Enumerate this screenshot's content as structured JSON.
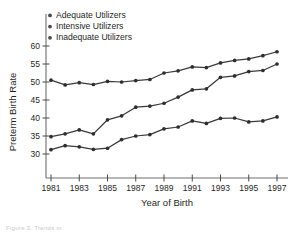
{
  "chart_data": {
    "type": "line",
    "title": "",
    "xlabel": "Year of Birth",
    "ylabel": "Preterm Birth Rate",
    "x": [
      1981,
      1982,
      1983,
      1984,
      1985,
      1986,
      1987,
      1988,
      1989,
      1990,
      1991,
      1992,
      1993,
      1994,
      1995,
      1996,
      1997
    ],
    "xtick_labels": [
      "1981",
      "1983",
      "1985",
      "1987",
      "1989",
      "1991",
      "1993",
      "1995",
      "1997"
    ],
    "xticks": [
      1981,
      1983,
      1985,
      1987,
      1989,
      1991,
      1993,
      1995,
      1997
    ],
    "ytick_labels": [
      "30",
      "35",
      "40",
      "45",
      "50",
      "55",
      "60"
    ],
    "yticks": [
      30,
      35,
      40,
      45,
      50,
      55,
      60
    ],
    "ylim": [
      28.5,
      61.5
    ],
    "xlim": [
      1980.3,
      1997.7
    ],
    "grid": false,
    "legend_position": "top-left",
    "marker": "circle",
    "series": [
      {
        "name": "Adequate Utilizers",
        "color": "#2e2e2e",
        "values": [
          50.5,
          49.2,
          49.8,
          49.3,
          50.2,
          50.0,
          50.4,
          50.7,
          52.5,
          53.1,
          54.2,
          54.0,
          55.3,
          56.0,
          56.4,
          57.3,
          58.4
        ]
      },
      {
        "name": "Intensive Utilizers",
        "color": "#2e2e2e",
        "values": [
          34.8,
          35.6,
          36.7,
          35.6,
          39.5,
          40.6,
          43.0,
          43.3,
          44.1,
          45.8,
          47.8,
          48.1,
          51.3,
          51.7,
          52.9,
          53.2,
          55.0
        ]
      },
      {
        "name": "Inadequate Utilizers",
        "color": "#2e2e2e",
        "values": [
          31.2,
          32.3,
          32.0,
          31.3,
          31.6,
          34.0,
          35.0,
          35.4,
          37.0,
          37.5,
          39.2,
          38.5,
          39.9,
          40.0,
          38.9,
          39.2,
          40.3
        ]
      }
    ]
  },
  "legend": {
    "items": [
      {
        "label": "Adequate Utilizers"
      },
      {
        "label": "Intensive Utilizers"
      },
      {
        "label": "Inadequate Utilizers"
      }
    ]
  },
  "axes": {
    "y_title": "Preterm Birth Rate",
    "x_title": "Year of Birth"
  },
  "footer": {
    "partial_text": "Figure 3.  Trends in"
  }
}
